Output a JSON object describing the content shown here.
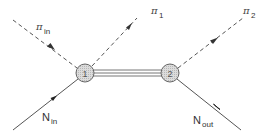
{
  "diagram": {
    "type": "feynman-like scattering diagram",
    "vertices": [
      {
        "id": "1",
        "label": "1",
        "cx": 85,
        "cy": 73,
        "r": 9
      },
      {
        "id": "2",
        "label": "2",
        "cx": 170,
        "cy": 73,
        "r": 9
      }
    ],
    "propagator": {
      "from": "1",
      "to": "2",
      "style": "triple-line"
    },
    "lines": [
      {
        "id": "pi_in",
        "style": "dashed",
        "particle": "π",
        "label_main": "π",
        "label_sub": "in",
        "direction": "into vertex 1"
      },
      {
        "id": "pi_1",
        "style": "dashed",
        "particle": "π",
        "label_main": "π",
        "label_sub": "1",
        "direction": "out of vertex 1"
      },
      {
        "id": "pi_2",
        "style": "dashed",
        "particle": "π",
        "label_main": "π",
        "label_sub": "2",
        "direction": "out of vertex 2"
      },
      {
        "id": "N_in",
        "style": "solid",
        "particle": "N",
        "label_main": "N",
        "label_sub": "in",
        "direction": "into vertex 1"
      },
      {
        "id": "N_out",
        "style": "solid",
        "particle": "N",
        "label_main": "N",
        "label_sub": "out",
        "direction": "out of vertex 2"
      }
    ],
    "colors": {
      "line": "#555555",
      "vertex_fill": "#d4d4d4",
      "vertex_stroke": "#666666",
      "text": "#333333"
    }
  }
}
